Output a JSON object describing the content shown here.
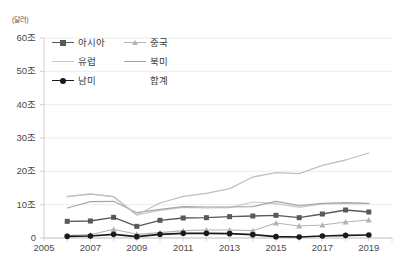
{
  "chart_data": {
    "type": "line",
    "title": "",
    "subtitle": "",
    "unit_label": "(달러)",
    "xlabel": "",
    "ylabel": "",
    "xlim": [
      2005,
      2020
    ],
    "ylim": [
      0,
      60
    ],
    "grid": true,
    "grid_axis": "y",
    "legend_position": "top-left-inside",
    "y_ticks": [
      0,
      10,
      20,
      30,
      40,
      50,
      60
    ],
    "y_tick_labels": [
      "0",
      "10조",
      "20조",
      "30조",
      "40조",
      "50조",
      "60조"
    ],
    "x_ticks": [
      2005,
      2007,
      2009,
      2011,
      2013,
      2015,
      2017,
      2019
    ],
    "x_tick_labels": [
      "2005",
      "2007",
      "2009",
      "2011",
      "2013",
      "2015",
      "2017",
      "2019"
    ],
    "x": [
      2006,
      2007,
      2008,
      2009,
      2010,
      2011,
      2012,
      2013,
      2014,
      2015,
      2016,
      2017,
      2018,
      2019
    ],
    "series": [
      {
        "name": "아시아",
        "color": "#595959",
        "marker": "square",
        "marker_color": "#595959",
        "line_width": 1.3,
        "values": [
          5.0,
          5.1,
          6.2,
          3.5,
          5.3,
          6.0,
          6.1,
          6.4,
          6.6,
          6.8,
          6.1,
          7.2,
          8.4,
          7.8
        ]
      },
      {
        "name": "중국",
        "color": "#b3b3b3",
        "marker": "triangle",
        "marker_color": "#b3b3b3",
        "line_width": 1.1,
        "values": [
          0.7,
          1.0,
          2.6,
          1.1,
          1.6,
          2.2,
          2.4,
          2.4,
          2.2,
          4.5,
          3.6,
          3.9,
          4.8,
          5.4
        ]
      },
      {
        "name": "유럽",
        "color": "#c9c9c9",
        "marker": "none",
        "marker_color": "#c9c9c9",
        "line_width": 1.2,
        "values": [
          12.4,
          13.2,
          12.4,
          6.9,
          8.3,
          9.2,
          9.0,
          9.1,
          10.8,
          10.3,
          9.2,
          10.2,
          10.4,
          10.3
        ]
      },
      {
        "name": "북미",
        "color": "#a6a6a6",
        "marker": "none",
        "marker_color": "#a6a6a6",
        "line_width": 1.2,
        "values": [
          9.0,
          10.9,
          11.0,
          7.6,
          8.6,
          9.4,
          9.3,
          9.3,
          9.4,
          11.0,
          9.7,
          10.4,
          10.6,
          10.4
        ]
      },
      {
        "name": "남미",
        "color": "#1a1a1a",
        "marker": "circle",
        "marker_color": "#1a1a1a",
        "line_width": 1.6,
        "values": [
          0.5,
          0.6,
          1.1,
          0.4,
          1.1,
          1.4,
          1.4,
          1.3,
          1.0,
          0.4,
          0.3,
          0.6,
          0.8,
          0.9
        ]
      },
      {
        "name": "합계",
        "color": "#c0c0c0",
        "marker": "none",
        "marker_color": "#c0c0c0",
        "line_width": 1.3,
        "values": [
          12.4,
          13.2,
          12.4,
          6.9,
          10.5,
          12.5,
          13.4,
          14.8,
          18.3,
          19.6,
          19.3,
          21.8,
          23.4,
          25.5
        ]
      }
    ],
    "legend_entries": [
      {
        "label": "아시아",
        "color": "#595959",
        "marker": "square",
        "show_line": true
      },
      {
        "label": "중국",
        "color": "#b3b3b3",
        "marker": "triangle",
        "show_line": true
      },
      {
        "label": "유럽",
        "color": "#c9c9c9",
        "marker": "none",
        "show_line": true
      },
      {
        "label": "북미",
        "color": "#a6a6a6",
        "marker": "none",
        "show_line": true
      },
      {
        "label": "남미",
        "color": "#1a1a1a",
        "marker": "circle",
        "show_line": true
      },
      {
        "label": "합계",
        "color": "#e0e0e0",
        "marker": "none",
        "show_line": false
      }
    ]
  }
}
